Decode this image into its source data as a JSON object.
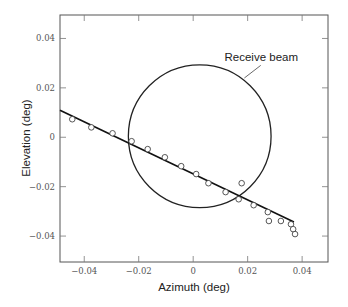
{
  "chart_data": {
    "type": "scatter",
    "title": "",
    "xlabel": "Azimuth (deg)",
    "ylabel": "Elevation (deg)",
    "xlim": [
      -0.0489,
      0.0495
    ],
    "ylim": [
      -0.0505,
      0.0495
    ],
    "grid": false,
    "x_ticks": [
      -0.04,
      -0.02,
      0,
      0.02,
      0.04
    ],
    "y_ticks": [
      -0.04,
      -0.02,
      0,
      0.02,
      0.04
    ],
    "x_tick_labels": [
      "−0.04",
      "−0.02",
      "0",
      "0.02",
      "0.04"
    ],
    "y_tick_labels": [
      "−0.04",
      "−0.02",
      "0",
      "0.02",
      "0.04"
    ],
    "series": [
      {
        "name": "measurements",
        "marker": "open-circle",
        "points": [
          [
            -0.0444,
            0.0073
          ],
          [
            -0.0374,
            0.004
          ],
          [
            -0.0296,
            0.0016
          ],
          [
            -0.0226,
            -0.0016
          ],
          [
            -0.0167,
            -0.0048
          ],
          [
            -0.0104,
            -0.0081
          ],
          [
            -0.0044,
            -0.0117
          ],
          [
            0.0011,
            -0.0149
          ],
          [
            0.0056,
            -0.0186
          ],
          [
            0.0119,
            -0.0222
          ],
          [
            0.0178,
            -0.0186
          ],
          [
            0.0167,
            -0.0251
          ],
          [
            0.0222,
            -0.0275
          ],
          [
            0.0274,
            -0.0303
          ],
          [
            0.0278,
            -0.0339
          ],
          [
            0.0322,
            -0.0339
          ],
          [
            0.0359,
            -0.0352
          ],
          [
            0.0367,
            -0.0372
          ],
          [
            0.0374,
            -0.0392
          ]
        ]
      },
      {
        "name": "fit line",
        "type": "line",
        "points": [
          [
            -0.0489,
            0.0109
          ],
          [
            0.037,
            -0.0343
          ]
        ]
      }
    ],
    "annotations": [
      {
        "name": "receive-beam",
        "shape": "circle",
        "center": [
          0.0024,
          0.0004
        ],
        "radius": 0.0262,
        "label": "Receive beam",
        "label_at": [
          0.0115,
          0.031
        ],
        "leader": [
          [
            0.0188,
            0.024
          ],
          [
            0.0248,
            0.0291
          ]
        ]
      }
    ]
  }
}
